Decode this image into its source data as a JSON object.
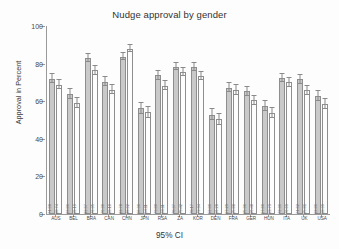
{
  "chart_data": {
    "type": "bar",
    "title": "Nudge approval by gender",
    "xlabel": "95% CI",
    "ylabel": "Approval in Percent",
    "ylim": [
      0,
      100
    ],
    "yticks": [
      0,
      20,
      40,
      60,
      80,
      100
    ],
    "grid": false,
    "legend_position": "none",
    "categories": [
      "AUS",
      "BEL",
      "BRA",
      "CAN",
      "CHN",
      "JPN",
      "RSA",
      "ZA",
      "KOR",
      "DEN",
      "FRA",
      "GER",
      "HUN",
      "ITA",
      "UK",
      "USA"
    ],
    "series": [
      {
        "name": "male",
        "style": "filled-grey",
        "values": [
          71.98,
          63.86,
          82.97,
          70.36,
          83.78,
          56.3,
          73.8,
          78.37,
          78.17,
          52.8,
          67.29,
          65.36,
          57.6,
          72.36,
          71.62,
          62.86
        ],
        "ci_low": [
          69.6,
          61.3,
          81.0,
          67.9,
          81.8,
          53.4,
          71.5,
          76.4,
          76.1,
          50.0,
          64.9,
          62.9,
          54.9,
          70.1,
          69.3,
          60.3
        ],
        "ci_high": [
          74.3,
          66.4,
          84.9,
          72.8,
          85.8,
          59.2,
          76.1,
          80.3,
          80.2,
          55.6,
          69.7,
          67.8,
          60.3,
          74.6,
          73.9,
          65.4
        ]
      },
      {
        "name": "female",
        "style": "open-white",
        "values": [
          68.74,
          59.19,
          76.35,
          66.1,
          88.02,
          54.11,
          68.11,
          75.42,
          73.34,
          50.28,
          65.88,
          60.48,
          53.73,
          70.09,
          65.81,
          58.39
        ],
        "ci_low": [
          66.3,
          56.6,
          74.2,
          63.6,
          86.3,
          51.2,
          65.7,
          73.4,
          71.2,
          47.5,
          63.4,
          58.0,
          51.0,
          67.8,
          63.4,
          55.8
        ],
        "ci_high": [
          71.2,
          61.8,
          78.5,
          68.6,
          89.8,
          57.0,
          70.5,
          77.5,
          75.5,
          53.1,
          68.4,
          63.0,
          56.5,
          72.4,
          68.2,
          61.0
        ]
      }
    ]
  }
}
